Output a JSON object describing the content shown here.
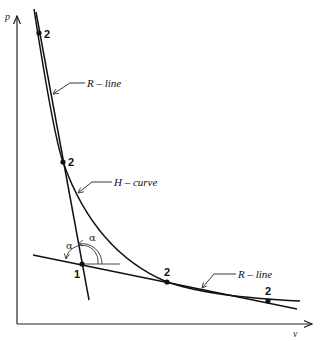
{
  "diagram": {
    "axes": {
      "y_label": "p",
      "x_label": "v"
    },
    "curves": [
      {
        "name": "H-curve",
        "label": "H – curve"
      },
      {
        "name": "R-line-upper",
        "label": "R – line"
      },
      {
        "name": "R-line-lower",
        "label": "R – line"
      }
    ],
    "points": [
      {
        "id": "top",
        "label": "2"
      },
      {
        "id": "mid",
        "label": "2"
      },
      {
        "id": "initial",
        "label": "1"
      },
      {
        "id": "lower",
        "label": "2"
      },
      {
        "id": "right",
        "label": "2"
      }
    ],
    "angles": [
      {
        "label": "α"
      },
      {
        "label": "α"
      }
    ]
  }
}
